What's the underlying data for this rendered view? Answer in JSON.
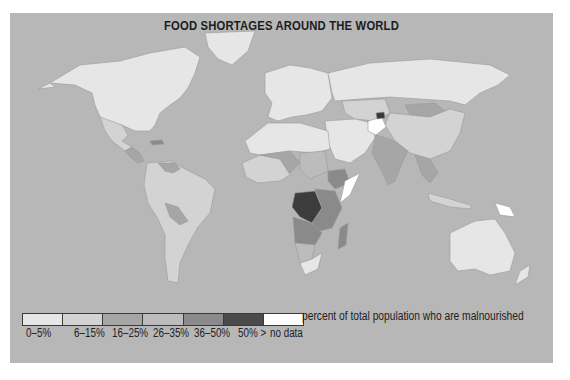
{
  "title": "FOOD SHORTAGES AROUND THE WORLD",
  "colors": {
    "ocean": "#b7b7b7",
    "border": "#9a9a9a"
  },
  "legend": {
    "caption": "percent of total population who are malnourished",
    "items": [
      {
        "label": "0–5%",
        "color": "#e6e6e6"
      },
      {
        "label": "6–15%",
        "color": "#d3d3d3"
      },
      {
        "label": "16–25%",
        "color": "#a6a6a6"
      },
      {
        "label": "26–35%",
        "color": "#bcbcbc"
      },
      {
        "label": "36–50%",
        "color": "#8a8a8a"
      },
      {
        "label": "50% >",
        "color": "#4a4a4a"
      },
      {
        "label": "no data",
        "color": "#ffffff"
      }
    ]
  },
  "regions": [
    {
      "name": "North America",
      "category": "0–5%"
    },
    {
      "name": "Greenland",
      "category": "0–5%"
    },
    {
      "name": "Mexico",
      "category": "6–15%"
    },
    {
      "name": "Central America",
      "category": "16–25%"
    },
    {
      "name": "Caribbean (Haiti)",
      "category": "36–50%"
    },
    {
      "name": "South America",
      "category": "6–15%"
    },
    {
      "name": "Venezuela/Colombia",
      "category": "16–25%"
    },
    {
      "name": "Bolivia/Paraguay",
      "category": "16–25%"
    },
    {
      "name": "Europe",
      "category": "0–5%"
    },
    {
      "name": "Russia",
      "category": "0–5%"
    },
    {
      "name": "Central Asia",
      "category": "6–15%"
    },
    {
      "name": "Mongolia",
      "category": "16–25%"
    },
    {
      "name": "China",
      "category": "6–15%"
    },
    {
      "name": "Middle East",
      "category": "0–5%"
    },
    {
      "name": "Afghanistan",
      "category": "no data"
    },
    {
      "name": "Tajikistan",
      "category": "50% >"
    },
    {
      "name": "India/South Asia",
      "category": "16–25%"
    },
    {
      "name": "Southeast Asia",
      "category": "16–25%"
    },
    {
      "name": "North Africa",
      "category": "0–5%"
    },
    {
      "name": "West Africa",
      "category": "6–15%"
    },
    {
      "name": "Sahel",
      "category": "16–25%"
    },
    {
      "name": "Chad/Sudan",
      "category": "26–35%"
    },
    {
      "name": "Ethiopia/Eritrea",
      "category": "36–50%"
    },
    {
      "name": "Somalia",
      "category": "no data"
    },
    {
      "name": "DR Congo",
      "category": "50% >"
    },
    {
      "name": "Central/East Africa",
      "category": "36–50%"
    },
    {
      "name": "Angola/Zambia",
      "category": "36–50%"
    },
    {
      "name": "Madagascar",
      "category": "36–50%"
    },
    {
      "name": "Namibia/Botswana",
      "category": "26–35%"
    },
    {
      "name": "South Africa",
      "category": "0–5%"
    },
    {
      "name": "Australia",
      "category": "0–5%"
    },
    {
      "name": "New Zealand",
      "category": "0–5%"
    },
    {
      "name": "Papua New Guinea",
      "category": "no data"
    },
    {
      "name": "Indonesia",
      "category": "6–15%"
    }
  ]
}
